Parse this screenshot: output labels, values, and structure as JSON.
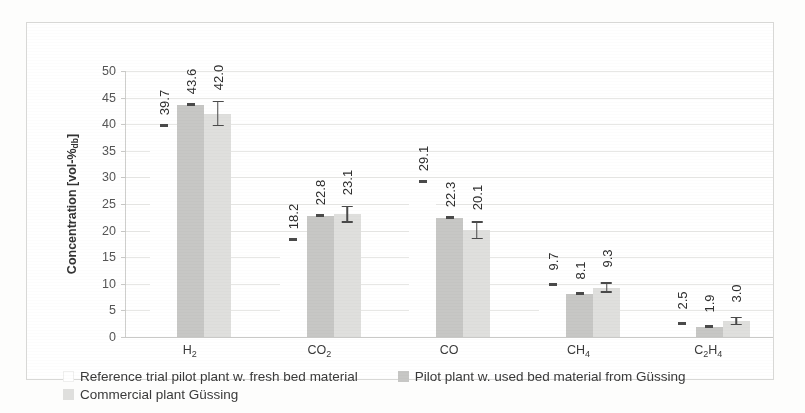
{
  "chart_data": {
    "type": "bar",
    "title": "",
    "xlabel": "",
    "ylabel": "Concentration [vol-%db]",
    "ylabel_main": "Concentration [vol-%",
    "ylabel_sub": "db",
    "ylabel_tail": "]",
    "ylim": [
      0,
      50
    ],
    "ytick_values": [
      0,
      5,
      10,
      15,
      20,
      25,
      30,
      35,
      40,
      45,
      50
    ],
    "ytick_labels": [
      "0",
      "5",
      "10",
      "15",
      "20",
      "25",
      "30",
      "35",
      "40",
      "45",
      "50"
    ],
    "grid": true,
    "legend_position": "bottom",
    "categories": [
      "H2",
      "CO2",
      "CO",
      "CH4",
      "C2H4"
    ],
    "category_labels": [
      {
        "base": "H",
        "sub": "2",
        "base2": "",
        "sub2": ""
      },
      {
        "base": "CO",
        "sub": "2",
        "base2": "",
        "sub2": ""
      },
      {
        "base": "CO",
        "sub": "",
        "base2": "",
        "sub2": ""
      },
      {
        "base": "CH",
        "sub": "4",
        "base2": "",
        "sub2": ""
      },
      {
        "base": "C",
        "sub": "2",
        "base2": "H",
        "sub2": "4"
      }
    ],
    "series": [
      {
        "name": "Reference trial pilot plant w. fresh bed material",
        "color": "#ffffff",
        "values": [
          39.7,
          18.2,
          29.1,
          9.7,
          2.5
        ],
        "labels": [
          "39.7",
          "18.2",
          "29.1",
          "9.7",
          "2.5"
        ],
        "errors": [
          0,
          0,
          0,
          0,
          0
        ],
        "marker_only": true
      },
      {
        "name": "Pilot plant w. used bed material from Güssing",
        "color": "#c7c7c5",
        "values": [
          43.6,
          22.8,
          22.3,
          8.1,
          1.9
        ],
        "labels": [
          "43.6",
          "22.8",
          "22.3",
          "8.1",
          "1.9"
        ],
        "errors": [
          0.5,
          0.4,
          0.5,
          0.3,
          0.2
        ],
        "marker_only": false
      },
      {
        "name": "Commercial plant Güssing",
        "color": "#dfdfdd",
        "values": [
          42.0,
          23.1,
          20.1,
          9.3,
          3.0
        ],
        "labels": [
          "42.0",
          "23.1",
          "20.1",
          "9.3",
          "3.0"
        ],
        "errors": [
          2.4,
          1.6,
          1.7,
          1.0,
          0.8
        ],
        "marker_only": false
      }
    ]
  },
  "legend": {
    "items": [
      {
        "label": "Reference trial pilot plant w. fresh bed material",
        "swatch": "sw1"
      },
      {
        "label": "Pilot plant w. used bed material from Güssing",
        "swatch": "sw2"
      },
      {
        "label": "Commercial plant Güssing",
        "swatch": "sw3"
      }
    ]
  }
}
